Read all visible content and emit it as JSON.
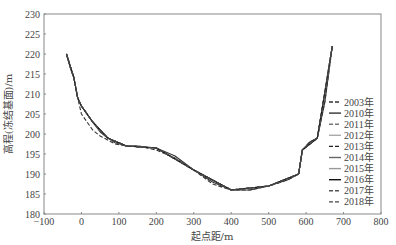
{
  "chart_data": {
    "type": "line",
    "title": "",
    "xlabel": "起点距/m",
    "ylabel": "高程(冻结基面)/m",
    "xlim": [
      -100,
      800
    ],
    "ylim": [
      180,
      230
    ],
    "xticks": [
      -100,
      0,
      100,
      200,
      300,
      400,
      500,
      600,
      700,
      800
    ],
    "yticks": [
      180,
      185,
      190,
      195,
      200,
      205,
      210,
      215,
      220,
      225,
      230
    ],
    "grid": false,
    "legend_position": "right-inside-lower",
    "series": [
      {
        "name": "2003年",
        "style": "dashed",
        "color": "#333333",
        "x": [
          -40,
          -28,
          -20,
          -10,
          0,
          15,
          30,
          50,
          70,
          90,
          120,
          150,
          200,
          250,
          300,
          350,
          400,
          450,
          500,
          550,
          580,
          590,
          610,
          630,
          650,
          670
        ],
        "y": [
          220,
          216,
          214,
          209,
          205,
          203,
          201,
          199.5,
          198.5,
          197.5,
          197,
          197,
          196,
          194,
          191,
          187.5,
          186,
          186,
          187,
          188.5,
          190,
          196,
          198,
          199,
          208,
          222
        ]
      },
      {
        "name": "2010年",
        "style": "solid",
        "color": "#333333",
        "x": [
          -40,
          -28,
          -20,
          -10,
          0,
          15,
          30,
          50,
          70,
          90,
          120,
          150,
          200,
          250,
          300,
          350,
          400,
          450,
          500,
          550,
          580,
          590,
          610,
          630,
          650,
          670
        ],
        "y": [
          220,
          216,
          214,
          209,
          207,
          205,
          203,
          200.5,
          199,
          197.8,
          197,
          197,
          196.5,
          194.5,
          191,
          188,
          186,
          186,
          187,
          188.5,
          190,
          196,
          198,
          199,
          208,
          222
        ]
      },
      {
        "name": "2011年",
        "style": "dashed",
        "color": "#777777",
        "x": [
          -40,
          -20,
          -10,
          0,
          30,
          70,
          120,
          200,
          300,
          400,
          500,
          580,
          590,
          630,
          670
        ],
        "y": [
          220,
          214,
          209,
          207,
          203,
          199,
          197,
          196.5,
          191,
          186,
          187,
          190,
          196,
          199,
          222
        ]
      },
      {
        "name": "2012年",
        "style": "solid",
        "color": "#aaaaaa",
        "x": [
          -40,
          -20,
          -10,
          0,
          30,
          70,
          120,
          200,
          300,
          400,
          500,
          580,
          590,
          630,
          670
        ],
        "y": [
          220,
          214,
          209,
          207,
          203,
          199,
          197,
          196.5,
          191,
          186,
          187,
          190,
          196,
          199,
          222
        ]
      },
      {
        "name": "2013年",
        "style": "dashed",
        "color": "#222222",
        "x": [
          -40,
          -20,
          -10,
          0,
          30,
          70,
          120,
          200,
          300,
          400,
          500,
          580,
          590,
          630,
          670
        ],
        "y": [
          220,
          214,
          209,
          207,
          203,
          199,
          197,
          196.5,
          191,
          186,
          187,
          190,
          196,
          199,
          222
        ]
      },
      {
        "name": "2014年",
        "style": "solid",
        "color": "#666666",
        "x": [
          -40,
          -20,
          -10,
          0,
          30,
          70,
          120,
          200,
          300,
          400,
          500,
          580,
          590,
          630,
          670
        ],
        "y": [
          220,
          214,
          209,
          207,
          203,
          199,
          197,
          196.5,
          191,
          186,
          187,
          190,
          196,
          199,
          222
        ]
      },
      {
        "name": "2015年",
        "style": "solid",
        "color": "#999999",
        "x": [
          -40,
          -20,
          -10,
          0,
          30,
          70,
          120,
          200,
          300,
          400,
          500,
          580,
          590,
          630,
          670
        ],
        "y": [
          220,
          214,
          209,
          207,
          203,
          199,
          197,
          196.5,
          191,
          186,
          187,
          190,
          196,
          199,
          222
        ]
      },
      {
        "name": "2016年",
        "style": "solid",
        "color": "#111111",
        "x": [
          -40,
          -20,
          -10,
          0,
          30,
          70,
          120,
          200,
          300,
          400,
          500,
          580,
          590,
          630,
          670
        ],
        "y": [
          220,
          214,
          209,
          207,
          203,
          199,
          197,
          196.5,
          191,
          186,
          187,
          190,
          196,
          199,
          222
        ]
      },
      {
        "name": "2017年",
        "style": "dashed",
        "color": "#555555",
        "x": [
          -40,
          -20,
          -10,
          0,
          30,
          70,
          120,
          200,
          300,
          400,
          500,
          580,
          590,
          630,
          670
        ],
        "y": [
          220,
          214,
          209,
          207,
          203,
          199,
          197,
          196.5,
          191,
          186,
          187,
          190,
          196,
          199,
          222
        ]
      },
      {
        "name": "2018年",
        "style": "dashed",
        "color": "#444444",
        "x": [
          -40,
          -20,
          -10,
          0,
          30,
          70,
          120,
          200,
          300,
          400,
          500,
          580,
          590,
          630,
          670
        ],
        "y": [
          220,
          214,
          209,
          207,
          203,
          199,
          197,
          196.5,
          191,
          186,
          187,
          190,
          196,
          199,
          222
        ]
      }
    ]
  }
}
